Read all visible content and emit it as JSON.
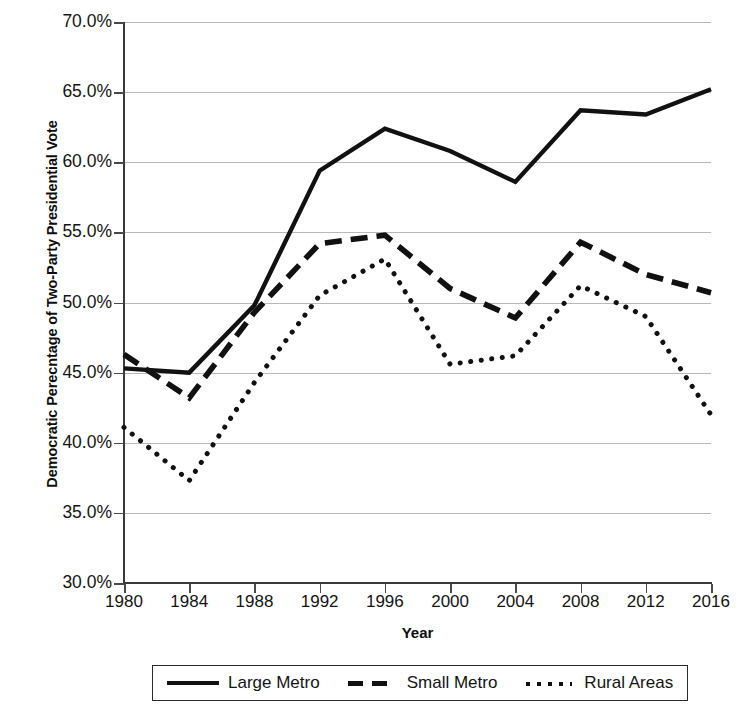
{
  "chart_data": {
    "type": "line",
    "title": "",
    "xlabel": "Year",
    "ylabel": "Democratic Perecntage of Two-Party Presidential Vote",
    "categories": [
      1980,
      1984,
      1988,
      1992,
      1996,
      2000,
      2004,
      2008,
      2012,
      2016
    ],
    "x_tick_labels": [
      "1980",
      "1984",
      "1988",
      "1992",
      "1996",
      "2000",
      "2004",
      "2008",
      "2012",
      "2016"
    ],
    "y_tick_labels": [
      "70.0%",
      "65.0%",
      "60.0%",
      "55.0%",
      "50.0%",
      "45.0%",
      "40.0%",
      "35.0%",
      "30.0%"
    ],
    "y_tick_values": [
      70.0,
      65.0,
      60.0,
      55.0,
      50.0,
      45.0,
      40.0,
      35.0,
      30.0
    ],
    "ylim": [
      30.0,
      70.0
    ],
    "xlim": [
      1980,
      2016
    ],
    "grid": true,
    "legend_position": "bottom",
    "series": [
      {
        "name": "Large Metro",
        "style": "solid",
        "color": "#111111",
        "values": [
          45.3,
          45.0,
          49.8,
          59.4,
          62.4,
          60.8,
          58.6,
          63.7,
          63.4,
          65.2
        ]
      },
      {
        "name": "Small Metro",
        "style": "dashed",
        "color": "#111111",
        "values": [
          46.3,
          43.2,
          49.3,
          54.2,
          54.8,
          51.0,
          48.9,
          54.3,
          52.0,
          50.7
        ]
      },
      {
        "name": "Rural Areas",
        "style": "dotted",
        "color": "#111111",
        "values": [
          41.1,
          37.3,
          44.3,
          50.5,
          53.1,
          45.6,
          46.2,
          51.2,
          49.0,
          42.0
        ]
      }
    ]
  },
  "legend": {
    "items": [
      {
        "label": "Large Metro",
        "style": "solid"
      },
      {
        "label": "Small Metro",
        "style": "dashed"
      },
      {
        "label": "Rural Areas",
        "style": "dotted"
      }
    ]
  }
}
